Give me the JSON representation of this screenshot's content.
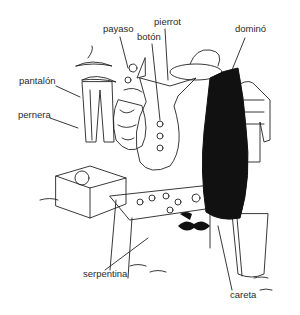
{
  "diagram": {
    "type": "labeled-illustration",
    "labels": [
      {
        "id": "payaso",
        "text": "payaso",
        "x": 103,
        "y": 28
      },
      {
        "id": "boton",
        "text": "botón",
        "x": 137,
        "y": 36
      },
      {
        "id": "pierrot",
        "text": "pierrot",
        "x": 154,
        "y": 21
      },
      {
        "id": "domino",
        "text": "dominó",
        "x": 235,
        "y": 28
      },
      {
        "id": "pantalon",
        "text": "pantalón",
        "x": 19,
        "y": 80
      },
      {
        "id": "pernera",
        "text": "pernera",
        "x": 18,
        "y": 114
      },
      {
        "id": "serpentina",
        "text": "serpentina",
        "x": 83,
        "y": 271
      },
      {
        "id": "careta",
        "text": "careta",
        "x": 230,
        "y": 294
      }
    ]
  }
}
